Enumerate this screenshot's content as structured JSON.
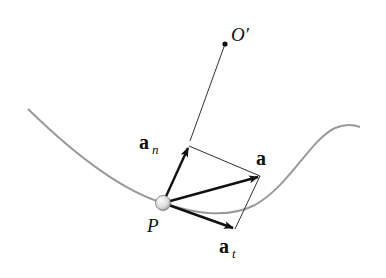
{
  "diagram": {
    "colors": {
      "background": "#ffffff",
      "path": "#9a9a9a",
      "vector": "#111111",
      "construction": "#333333",
      "particle": "#e6e6e6"
    },
    "labels": {
      "center_of_curvature": "O′",
      "particle": "P",
      "acceleration": "a",
      "normal_base": "a",
      "normal_sub": "n",
      "tangential_base": "a",
      "tangential_sub": "t"
    },
    "points": {
      "O_prime": [
        225,
        44
      ],
      "P": [
        163,
        203
      ],
      "a_n_tip": [
        189,
        146
      ],
      "a_tip": [
        260,
        176
      ],
      "a_t_tip": [
        235,
        229
      ]
    }
  }
}
